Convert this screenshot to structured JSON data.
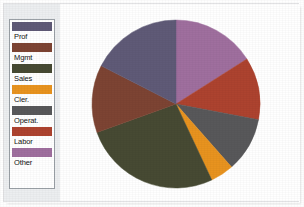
{
  "chart_data": {
    "type": "pie",
    "title": "",
    "xlabel": "",
    "ylabel": "",
    "legend_position": "left",
    "grid": false,
    "start_angle_deg": 0,
    "direction": "clockwise",
    "categories": [
      "Prof",
      "Mgmt",
      "Sales",
      "Cler.",
      "Operat.",
      "Labor",
      "Other"
    ],
    "values": [
      17.5,
      13.0,
      26.5,
      4.5,
      10.5,
      12.0,
      16.0
    ],
    "colors": [
      "#5f5a77",
      "#7d4433",
      "#474a33",
      "#e8931f",
      "#58585a",
      "#ad432f",
      "#9f6f9e"
    ],
    "slices": [
      {
        "label": "Other",
        "value": 16.0,
        "color": "#9f6f9e",
        "start_deg": 0.0,
        "end_deg": 57.6
      },
      {
        "label": "Labor",
        "value": 12.0,
        "color": "#ad432f",
        "start_deg": 57.6,
        "end_deg": 100.8
      },
      {
        "label": "Operat.",
        "value": 10.5,
        "color": "#58585a",
        "start_deg": 100.8,
        "end_deg": 138.6
      },
      {
        "label": "Cler.",
        "value": 4.5,
        "color": "#e8931f",
        "start_deg": 138.6,
        "end_deg": 154.8
      },
      {
        "label": "Sales",
        "value": 26.5,
        "color": "#474a33",
        "start_deg": 154.8,
        "end_deg": 250.2
      },
      {
        "label": "Mgmt",
        "value": 13.0,
        "color": "#7d4433",
        "start_deg": 250.2,
        "end_deg": 297.0
      },
      {
        "label": "Prof",
        "value": 17.5,
        "color": "#5f5a77",
        "start_deg": 297.0,
        "end_deg": 360.0
      }
    ]
  },
  "legend": {
    "items": [
      {
        "label": "Prof",
        "color": "#5f5a77"
      },
      {
        "label": "Mgmt",
        "color": "#7d4433"
      },
      {
        "label": "Sales",
        "color": "#474a33"
      },
      {
        "label": "Cler.",
        "color": "#e8931f"
      },
      {
        "label": "Operat.",
        "color": "#58585a"
      },
      {
        "label": "Labor",
        "color": "#ad432f"
      },
      {
        "label": "Other",
        "color": "#9f6f9e"
      }
    ]
  },
  "theme": {
    "page_background": "#ffffff",
    "gutter_background": "#eceef0",
    "legend_border": "#9aa0a6",
    "text_color": "#121212"
  }
}
